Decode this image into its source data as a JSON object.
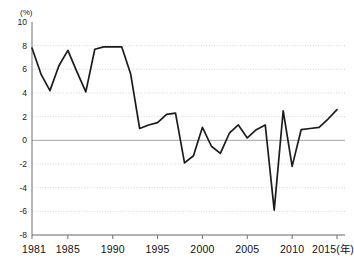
{
  "chart_data": {
    "type": "line",
    "title": "",
    "subtitle": "",
    "unit_label": "(%)",
    "xlabel": "(年)",
    "ylabel": "",
    "grid": true,
    "legend": "none",
    "xlim": [
      1981,
      2015
    ],
    "ylim": [
      -8,
      10
    ],
    "ytick_values": [
      10,
      8,
      6,
      4,
      2,
      0,
      -2,
      -4,
      -6,
      -8
    ],
    "ytick_labels": [
      "10",
      "8",
      "6",
      "4",
      "2",
      "0",
      "-2",
      "-4",
      "-6",
      "-8"
    ],
    "xtick_values": [
      1981,
      1985,
      1990,
      1995,
      2000,
      2005,
      2010,
      2015
    ],
    "xtick_labels": [
      "1981",
      "1985",
      "1990",
      "1995",
      "2000",
      "2005",
      "2010",
      "2015"
    ],
    "x_axis_suffix": "(年)",
    "series": [
      {
        "name": "growth-rate",
        "color": "#1c1c1c",
        "x": [
          1981,
          1982,
          1983,
          1984,
          1985,
          1986,
          1987,
          1988,
          1989,
          1990,
          1991,
          1992,
          1993,
          1994,
          1995,
          1996,
          1997,
          1998,
          1999,
          2000,
          2001,
          2002,
          2003,
          2004,
          2005,
          2006,
          2007,
          2008,
          2009,
          2010,
          2011,
          2012,
          2013,
          2014,
          2015
        ],
        "values": [
          7.8,
          5.6,
          4.2,
          6.3,
          7.6,
          5.8,
          4.1,
          7.7,
          7.9,
          7.9,
          7.9,
          5.6,
          1.0,
          1.3,
          1.5,
          2.2,
          2.3,
          -1.9,
          -1.3,
          1.1,
          -0.5,
          -1.1,
          0.6,
          1.3,
          0.2,
          0.9,
          1.3,
          -5.9,
          2.5,
          -2.2,
          0.9,
          1.0,
          1.1,
          1.8,
          2.6
        ]
      }
    ]
  }
}
